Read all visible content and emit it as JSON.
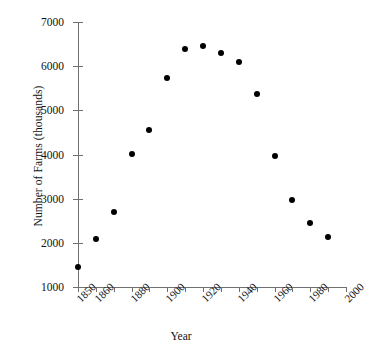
{
  "chart_data": {
    "type": "scatter",
    "title": "",
    "xlabel": "Year",
    "ylabel": "Number of Farms (thousands)",
    "xlim": [
      1850,
      2000
    ],
    "ylim": [
      1000,
      7000
    ],
    "grid": false,
    "legend": null,
    "x": [
      1850,
      1860,
      1870,
      1880,
      1890,
      1900,
      1910,
      1920,
      1930,
      1940,
      1950,
      1960,
      1970,
      1980,
      1990
    ],
    "values": [
      1450,
      2080,
      2700,
      4020,
      4560,
      5740,
      6390,
      6450,
      6300,
      6100,
      5380,
      3960,
      2960,
      2450,
      2130
    ],
    "points": [
      {
        "x": 1850,
        "y": 1450
      },
      {
        "x": 1860,
        "y": 2080
      },
      {
        "x": 1870,
        "y": 2700
      },
      {
        "x": 1880,
        "y": 4020
      },
      {
        "x": 1890,
        "y": 4560
      },
      {
        "x": 1900,
        "y": 5740
      },
      {
        "x": 1910,
        "y": 6390
      },
      {
        "x": 1920,
        "y": 6450
      },
      {
        "x": 1930,
        "y": 6300
      },
      {
        "x": 1940,
        "y": 6100
      },
      {
        "x": 1950,
        "y": 5380
      },
      {
        "x": 1960,
        "y": 3960
      },
      {
        "x": 1970,
        "y": 2960
      },
      {
        "x": 1980,
        "y": 2450
      },
      {
        "x": 1990,
        "y": 2130
      }
    ],
    "yticks": [
      1000,
      2000,
      3000,
      4000,
      5000,
      6000,
      7000
    ],
    "ytick_labels": [
      "1000",
      "2000",
      "3000",
      "4000",
      "5000",
      "6000",
      "7000"
    ],
    "xticks": [
      1850,
      1860,
      1870,
      1880,
      1890,
      1900,
      1910,
      1920,
      1930,
      1940,
      1950,
      1960,
      1970,
      1980,
      1990,
      2000
    ],
    "xtick_labels": [
      "1850",
      "1860",
      "",
      "1880",
      "",
      "1900",
      "",
      "1920",
      "",
      "1940",
      "",
      "1960",
      "",
      "1980",
      "",
      "2000"
    ],
    "marker_color": "#000000",
    "axis_color": "#707070"
  }
}
